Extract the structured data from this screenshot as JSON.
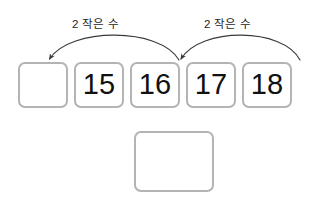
{
  "worksheet": {
    "title": "2 작은 수 number sequence worksheet",
    "arcs": [
      {
        "id": "arc-left",
        "label": "2 작은 수",
        "label_x": 72,
        "label_y": 16,
        "from_x": 180,
        "from_y": 60,
        "to_x": 48,
        "to_y": 60,
        "apex_y": 30,
        "direction": "right-to-left"
      },
      {
        "id": "arc-right",
        "label": "2 작은 수",
        "label_x": 204,
        "label_y": 16,
        "from_x": 300,
        "from_y": 60,
        "to_x": 180,
        "to_y": 60,
        "apex_y": 30,
        "direction": "right-to-left"
      }
    ],
    "number_boxes": [
      {
        "id": "box-blank-1",
        "value": "",
        "empty": true
      },
      {
        "id": "box-15",
        "value": "15",
        "empty": false
      },
      {
        "id": "box-16",
        "value": "16",
        "empty": false
      },
      {
        "id": "box-17",
        "value": "17",
        "empty": false
      },
      {
        "id": "box-18",
        "value": "18",
        "empty": false
      }
    ],
    "answer_box": {
      "id": "answer-box",
      "value": "",
      "empty": true
    },
    "colors": {
      "box_border": "#b4b4b4",
      "box_fill": "#ffffff",
      "number_text": "#111111",
      "label_text": "#1d1d1d",
      "arrow_stroke": "#3a3a3a",
      "page_background": "#ffffff"
    }
  }
}
